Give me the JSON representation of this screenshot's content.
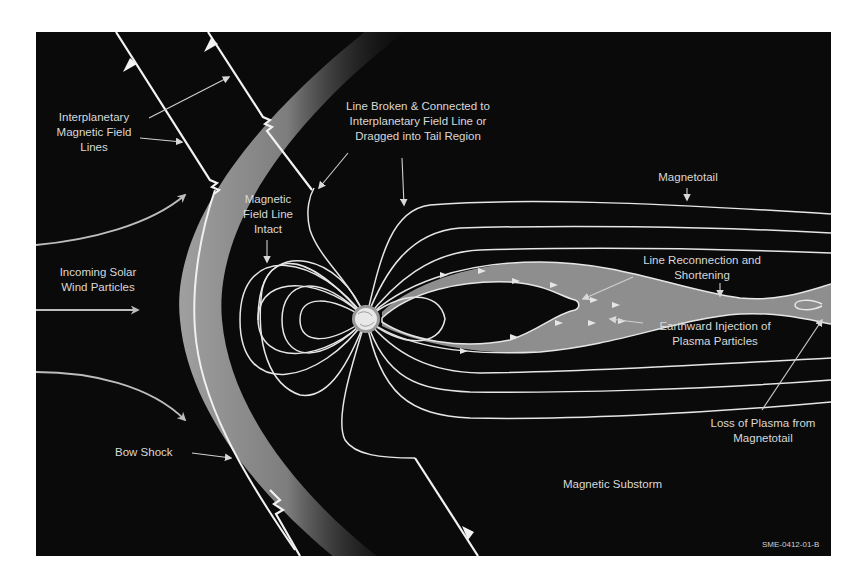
{
  "diagram": {
    "type": "magnetosphere-substorm",
    "colors": {
      "background": "#0a0a0a",
      "field_line": "#e6e6e6",
      "plasma_sheet": "#8e8e8e",
      "bow_shock_band": "#9a9a9a",
      "text": "#d8d8d8",
      "page": "#ffffff"
    },
    "labels": {
      "imf": [
        "Interplanetary",
        "Magnetic Field",
        "Lines"
      ],
      "broken": [
        "Line Broken & Connected to",
        "Interplanetary Field Line or",
        "Dragged into Tail Region"
      ],
      "intact": [
        "Magnetic",
        "Field Line",
        "Intact"
      ],
      "magnetotail": "Magnetotail",
      "solar_wind": [
        "Incoming Solar",
        "Wind Particles"
      ],
      "reconnection": [
        "Line Reconnection and",
        "Shortening"
      ],
      "injection": [
        "Earthward Injection of",
        "Plasma Particles"
      ],
      "loss": [
        "Loss of Plasma from",
        "Magnetotail"
      ],
      "bow_shock": "Bow Shock",
      "substorm": "Magnetic Substorm",
      "figure_code": "SME-0412-01-B"
    },
    "elements": {
      "earth": "earth-icon",
      "bow_shock": "bow-shock-band",
      "plasma_sheet": "plasma-sheet",
      "imf_lines": 2,
      "solar_wind_arrows": 3
    }
  }
}
